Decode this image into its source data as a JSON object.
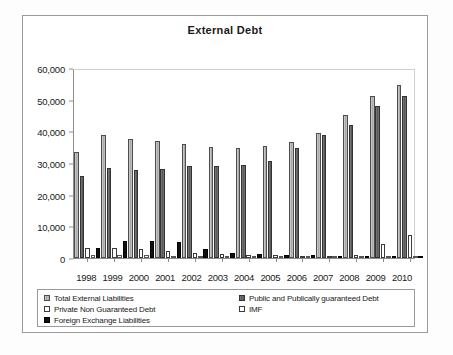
{
  "chart_data": {
    "type": "bar",
    "title": "External Debt",
    "xlabel": "",
    "ylabel": "",
    "ylim": [
      0,
      60000
    ],
    "yticks": [
      0,
      10000,
      20000,
      30000,
      40000,
      50000,
      60000
    ],
    "ytick_labels": [
      "0",
      "10,000",
      "20,000",
      "30,000",
      "40,000",
      "50,000",
      "60,000"
    ],
    "grid": false,
    "legend_position": "bottom",
    "categories": [
      "1998",
      "1999",
      "2000",
      "2001",
      "2002",
      "2003",
      "2004",
      "2005",
      "2006",
      "2007",
      "2008",
      "2009",
      "2010"
    ],
    "series": [
      {
        "name": "Total External Liabilities",
        "color": "#b4b4b4",
        "values": [
          33500,
          38700,
          37700,
          37000,
          36000,
          34900,
          34800,
          35400,
          36500,
          39600,
          45200,
          51300,
          54500
        ]
      },
      {
        "name": "Public and Publically guaranteed Debt",
        "color": "#666666",
        "values": [
          26000,
          28500,
          27700,
          28100,
          29000,
          28900,
          29500,
          30700,
          34600,
          38900,
          42100,
          48000,
          51200
        ]
      },
      {
        "name": "Private Non Guaranteed Debt",
        "color": "#ffffff",
        "values": [
          3200,
          3100,
          2900,
          2200,
          1600,
          1400,
          1100,
          800,
          500,
          400,
          900,
          4300,
          7200
        ]
      },
      {
        "name": "IMF",
        "color": "#ffffff",
        "values": [
          1100,
          900,
          800,
          600,
          400,
          300,
          200,
          200,
          150,
          100,
          100,
          100,
          100
        ]
      },
      {
        "name": "Foreign Exchange Liabilities",
        "color": "#111111",
        "values": [
          3100,
          5400,
          5500,
          4900,
          2900,
          1700,
          1400,
          1100,
          800,
          300,
          600,
          400,
          400
        ]
      }
    ]
  },
  "legend": {
    "left_items": [
      {
        "label": "Total External Liabilities",
        "swatch": "light-gray-striped"
      },
      {
        "label": "Private Non Guaranteed Debt",
        "swatch": "white"
      },
      {
        "label": "Foreign Exchange Liabilities",
        "swatch": "black"
      }
    ],
    "right_items": [
      {
        "label": "Public and Publically guaranteed Debt",
        "swatch": "dark-gray"
      },
      {
        "label": "IMF",
        "swatch": "white"
      }
    ]
  }
}
